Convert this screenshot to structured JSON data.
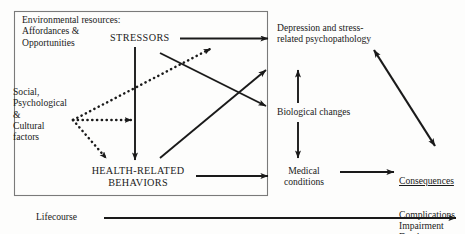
{
  "diagram": {
    "type": "flow-diagram",
    "canvas": {
      "width": 465,
      "height": 234
    },
    "colors": {
      "ink": "#1a1a1a",
      "background": "#fdfdfc",
      "border": "#6b6b6b"
    },
    "box": {
      "name": "upstream-determinants-box",
      "x": 14,
      "y": 11,
      "width": 254,
      "height": 185
    },
    "nodes": [
      {
        "id": "environmental-resources",
        "lines": [
          "Environmental resources:",
          "Affordances &",
          "Opportunities"
        ],
        "text": "Environmental resources:\nAffordances &\nOpportunities"
      },
      {
        "id": "social-factors",
        "lines": [
          "Social,",
          "Psychological",
          "&",
          "Cultural",
          "factors"
        ],
        "text": "Social,\nPsychological\n&\nCultural\nfactors"
      },
      {
        "id": "stressors",
        "lines": [
          "STRESSORS"
        ],
        "text": "STRESSORS"
      },
      {
        "id": "health-related-behaviors",
        "lines": [
          "HEALTH-RELATED",
          "BEHAVIORS"
        ],
        "text": "HEALTH-RELATED\nBEHAVIORS"
      },
      {
        "id": "depression",
        "lines": [
          "Depression and stress-",
          "related psychopathology"
        ],
        "text": "Depression and stress-\nrelated psychopathology"
      },
      {
        "id": "biological-changes",
        "lines": [
          "Biological changes"
        ],
        "text": "Biological changes"
      },
      {
        "id": "medical-conditions",
        "lines": [
          "Medical",
          "conditions"
        ],
        "text": "Medical\nconditions"
      },
      {
        "id": "consequences",
        "heading": "Consequences",
        "lines": [
          "Complications",
          "Impairment",
          "Death"
        ],
        "text": "Complications\nImpairment\nDeath"
      },
      {
        "id": "lifecourse",
        "lines": [
          "Lifecourse"
        ],
        "text": "Lifecourse"
      }
    ],
    "edges": [
      {
        "id": "stressors-to-depression",
        "style": "solid",
        "heads": "single",
        "from": "stressors",
        "to": "depression"
      },
      {
        "id": "stressors-to-health-behaviors",
        "style": "solid",
        "heads": "single",
        "from": "stressors",
        "to": "health-related-behaviors"
      },
      {
        "id": "stressors-diagonal-to-biological",
        "style": "solid",
        "heads": "single",
        "from": "stressors",
        "to": "biological-changes"
      },
      {
        "id": "health-behaviors-diagonal-to-depression",
        "style": "solid",
        "heads": "single",
        "from": "health-related-behaviors",
        "to": "depression"
      },
      {
        "id": "social-to-stressors-upper",
        "style": "dotted",
        "heads": "single",
        "from": "social-factors",
        "to": "stressors"
      },
      {
        "id": "social-to-stressors-middle",
        "style": "dotted",
        "heads": "single",
        "from": "social-factors",
        "to": "stressors"
      },
      {
        "id": "social-to-health-behaviors",
        "style": "dotted",
        "heads": "single",
        "from": "social-factors",
        "to": "health-related-behaviors"
      },
      {
        "id": "biological-to-depression",
        "style": "solid",
        "heads": "single",
        "from": "biological-changes",
        "to": "depression"
      },
      {
        "id": "biological-to-medical",
        "style": "solid",
        "heads": "single",
        "from": "biological-changes",
        "to": "medical-conditions"
      },
      {
        "id": "health-behaviors-to-medical",
        "style": "solid",
        "heads": "single",
        "from": "health-related-behaviors",
        "to": "medical-conditions"
      },
      {
        "id": "medical-to-consequences",
        "style": "solid",
        "heads": "single",
        "from": "medical-conditions",
        "to": "consequences"
      },
      {
        "id": "depression-consequences-bidirectional",
        "style": "solid",
        "heads": "double",
        "from": "depression",
        "to": "consequences"
      },
      {
        "id": "lifecourse-axis",
        "style": "solid",
        "heads": "single",
        "from": "lifecourse",
        "to": "consequences"
      }
    ]
  }
}
